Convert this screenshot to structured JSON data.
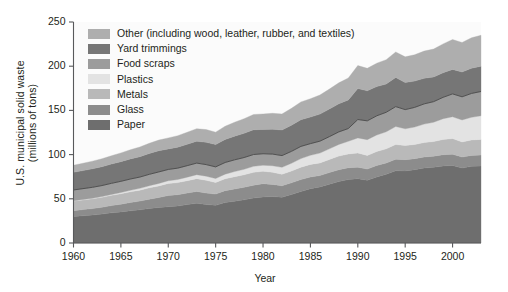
{
  "chart_data": {
    "type": "area",
    "stacked": true,
    "title": "",
    "xlabel": "Year",
    "ylabel": "U.S. municipal solid waste (millions of tons)",
    "ylabel_lines": [
      "U.S. municipal solid waste",
      "(millions of tons)"
    ],
    "xlim": [
      1960,
      2003
    ],
    "ylim": [
      0,
      250
    ],
    "yticks": [
      0,
      50,
      100,
      150,
      200,
      250
    ],
    "xticks": [
      1960,
      1965,
      1970,
      1975,
      1980,
      1985,
      1990,
      1995,
      2000
    ],
    "ytick_labels": [
      "0",
      "50",
      "100",
      "150",
      "200",
      "250"
    ],
    "xtick_labels": [
      "1960",
      "1965",
      "1970",
      "1975",
      "1980",
      "1985",
      "1990",
      "1995",
      "2000"
    ],
    "grid": false,
    "legend_position": "upper-left-inside",
    "x": [
      1960,
      1961,
      1962,
      1963,
      1964,
      1965,
      1966,
      1967,
      1968,
      1969,
      1970,
      1971,
      1972,
      1973,
      1974,
      1975,
      1976,
      1977,
      1978,
      1979,
      1980,
      1981,
      1982,
      1983,
      1984,
      1985,
      1986,
      1987,
      1988,
      1989,
      1990,
      1991,
      1992,
      1993,
      1994,
      1995,
      1996,
      1997,
      1998,
      1999,
      2000,
      2001,
      2002,
      2003
    ],
    "series": [
      {
        "name": "Paper",
        "color": "#6e6e6e",
        "values": [
          29.9,
          30.8,
          31.6,
          32.7,
          34.1,
          35.2,
          36.4,
          37.5,
          39.0,
          40.2,
          41.0,
          41.8,
          43.5,
          44.9,
          43.5,
          42.6,
          45.7,
          47.3,
          48.8,
          50.8,
          52.0,
          52.5,
          51.8,
          54.8,
          58.2,
          61.5,
          63.4,
          66.5,
          69.5,
          71.8,
          72.7,
          71.0,
          74.8,
          77.8,
          81.7,
          81.5,
          83.0,
          84.8,
          85.6,
          87.1,
          87.7,
          84.8,
          86.7,
          87.0
        ]
      },
      {
        "name": "Glass",
        "color": "#8c8c8c",
        "values": [
          6.7,
          7.0,
          7.3,
          7.7,
          8.2,
          8.7,
          9.3,
          9.9,
          10.6,
          11.3,
          12.7,
          12.9,
          13.0,
          13.4,
          13.0,
          12.7,
          13.5,
          13.8,
          14.2,
          14.6,
          15.1,
          13.8,
          12.9,
          13.3,
          13.5,
          13.2,
          12.9,
          13.2,
          13.4,
          13.3,
          13.1,
          12.6,
          12.9,
          12.7,
          13.1,
          12.8,
          12.4,
          12.5,
          12.6,
          12.8,
          12.8,
          12.4,
          12.4,
          12.5
        ]
      },
      {
        "name": "Metals",
        "color": "#b9b9b9",
        "values": [
          10.8,
          10.9,
          11.1,
          11.3,
          11.6,
          11.8,
          12.2,
          12.4,
          12.8,
          13.1,
          13.6,
          13.6,
          14.0,
          14.5,
          14.4,
          13.1,
          13.5,
          13.9,
          14.2,
          14.5,
          14.1,
          13.7,
          13.1,
          13.3,
          14.1,
          14.2,
          14.3,
          14.8,
          15.4,
          15.6,
          16.0,
          15.4,
          15.8,
          16.0,
          16.6,
          16.0,
          16.0,
          16.4,
          16.6,
          17.2,
          17.6,
          17.1,
          17.5,
          17.7
        ]
      },
      {
        "name": "Plastics",
        "color": "#e3e3e3",
        "values": [
          0.4,
          0.5,
          0.6,
          0.8,
          1.0,
          1.4,
          1.7,
          2.0,
          2.4,
          2.8,
          3.1,
          3.5,
          4.0,
          4.5,
          4.7,
          4.5,
          5.2,
          5.8,
          6.2,
          6.8,
          6.8,
          7.4,
          7.8,
          8.8,
          9.7,
          10.3,
          11.1,
          12.0,
          13.2,
          14.3,
          17.1,
          17.9,
          18.7,
          19.3,
          20.4,
          18.9,
          19.8,
          20.8,
          21.8,
          23.5,
          24.7,
          24.9,
          25.6,
          26.7
        ]
      },
      {
        "name": "Food scraps",
        "color": "#9c9c9c",
        "values": [
          12.2,
          12.3,
          12.4,
          12.5,
          12.6,
          12.7,
          12.8,
          12.8,
          12.9,
          13.0,
          12.8,
          12.9,
          13.0,
          13.1,
          13.1,
          13.2,
          13.2,
          13.3,
          13.3,
          13.4,
          13.0,
          13.2,
          13.3,
          13.5,
          13.8,
          13.2,
          13.5,
          13.8,
          14.2,
          14.5,
          20.8,
          21.3,
          21.7,
          22.1,
          22.5,
          21.7,
          22.2,
          22.9,
          23.3,
          24.2,
          25.9,
          26.2,
          27.0,
          27.5
        ]
      },
      {
        "name": "Yard trimmings",
        "color": "#767676",
        "values": [
          20.0,
          20.4,
          20.9,
          21.3,
          21.8,
          22.2,
          22.7,
          23.1,
          23.6,
          24.0,
          23.2,
          23.7,
          24.2,
          24.7,
          25.2,
          25.2,
          26.0,
          26.7,
          27.4,
          28.0,
          27.5,
          28.2,
          28.9,
          29.6,
          30.2,
          30.0,
          30.6,
          31.2,
          31.8,
          32.4,
          35.0,
          34.0,
          33.0,
          32.0,
          32.9,
          30.6,
          29.8,
          28.9,
          27.9,
          27.7,
          27.7,
          28.0,
          28.5,
          28.6
        ]
      },
      {
        "name": "Other (including wood, leather, rubber, and textiles)",
        "color": "#aeaeae",
        "values": [
          8.0,
          8.3,
          8.7,
          9.0,
          9.4,
          9.9,
          10.4,
          10.9,
          11.5,
          12.0,
          12.5,
          13.0,
          13.6,
          14.2,
          14.4,
          14.1,
          15.0,
          15.8,
          16.5,
          17.3,
          17.5,
          17.9,
          18.2,
          19.0,
          20.1,
          20.8,
          21.6,
          22.6,
          23.7,
          24.8,
          26.0,
          25.4,
          26.5,
          27.5,
          28.9,
          29.1,
          29.8,
          30.8,
          31.6,
          32.7,
          33.8,
          33.4,
          34.4,
          35.0
        ]
      }
    ],
    "legend_entries": [
      {
        "label": "Other (including wood, leather, rubber, and textiles)",
        "color": "#aeaeae"
      },
      {
        "label": "Yard trimmings",
        "color": "#767676"
      },
      {
        "label": "Food scraps",
        "color": "#9c9c9c"
      },
      {
        "label": "Plastics",
        "color": "#e3e3e3"
      },
      {
        "label": "Metals",
        "color": "#b9b9b9"
      },
      {
        "label": "Glass",
        "color": "#8c8c8c"
      },
      {
        "label": "Paper",
        "color": "#6e6e6e"
      }
    ],
    "plot_background": "#fbfbfb",
    "axis_color": "#58595b"
  }
}
